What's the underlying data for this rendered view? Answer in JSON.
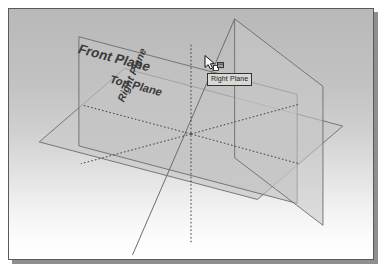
{
  "app": {
    "title": "Reference Planes Isometric View"
  },
  "viewport": {
    "background_top_color": "#b8b8b8",
    "background_bottom_color": "#ffffff",
    "border_color": "#5a5a5a",
    "shadow_color": "#8e8e8e"
  },
  "planes": [
    {
      "id": "front-plane",
      "label": "Front Plane",
      "fill_color": "#c3c3c3",
      "edge_color": "#6b6b6b"
    },
    {
      "id": "top-plane",
      "label": "Top Plane",
      "fill_color": "#c8c8c8",
      "edge_color": "#6b6b6b"
    },
    {
      "id": "right-plane",
      "label": "Right Plane",
      "fill_color": "#c6c6c6",
      "edge_color": "#6b6b6b"
    }
  ],
  "axes": {
    "style": "dotted",
    "color": "#3c3c3c"
  },
  "cursor": {
    "icon": "arrow-select-plane-cursor",
    "x": 195,
    "y": 46
  },
  "tooltip": {
    "text": "Right Plane",
    "background_color": "#d8d8d4",
    "border_color": "#333333"
  }
}
